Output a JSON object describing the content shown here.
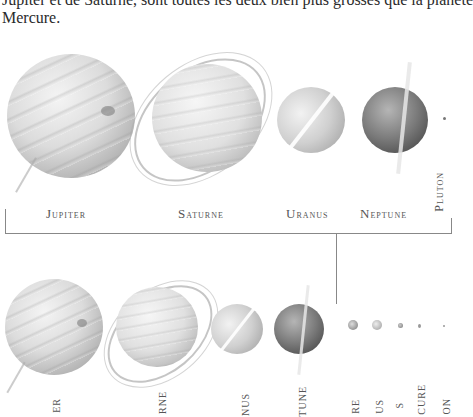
{
  "caption": {
    "line1": "Jupiter et de Saturne, sont toutes les deux bien plus grosses que la planète",
    "line2": "Mercure."
  },
  "top_row": {
    "labels": [
      {
        "first": "J",
        "rest": "upiter"
      },
      {
        "first": "S",
        "rest": "aturne"
      },
      {
        "first": "U",
        "rest": "ranus"
      },
      {
        "first": "N",
        "rest": "eptune"
      }
    ],
    "pluton_label": "Pluton"
  },
  "bottom_row": {
    "labels": [
      "ER",
      "RNE",
      "NUS",
      "TUNE",
      "RE",
      "US",
      "S",
      "CURE",
      "ON"
    ]
  },
  "colors": {
    "jupiter": "#cfcfcf",
    "saturne": "#d6d6d6",
    "uranus": "#c4c4c4",
    "neptune": "#6a6a6a",
    "bracket": "#888888"
  }
}
